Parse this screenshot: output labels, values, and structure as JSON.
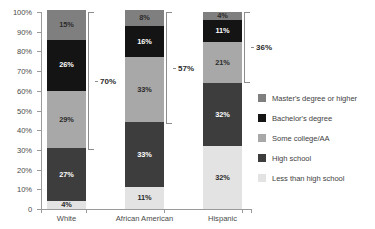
{
  "chart_data": {
    "type": "bar",
    "subtype": "stacked-percentage-column",
    "title": "",
    "xlabel": "",
    "ylabel": "",
    "ylim": [
      0,
      100
    ],
    "yunit": "%",
    "grid": false,
    "legend_position": "right",
    "categories": [
      "White",
      "African American",
      "Hispanic"
    ],
    "ytick_labels": [
      "0",
      "10%",
      "20%",
      "30%",
      "40%",
      "50%",
      "60%",
      "70%",
      "80%",
      "90%",
      "100%"
    ],
    "ytick_values": [
      0,
      10,
      20,
      30,
      40,
      50,
      60,
      70,
      80,
      90,
      100
    ],
    "series": [
      {
        "name": "Less than high school",
        "color": "#e3e3e3",
        "label_color": "dark",
        "values": [
          4,
          11,
          32
        ],
        "labels": [
          "4%",
          "11%",
          "32%"
        ]
      },
      {
        "name": "High school",
        "color": "#3d3d3d",
        "label_color": "light",
        "values": [
          27,
          33,
          32
        ],
        "labels": [
          "27%",
          "33%",
          "32%"
        ]
      },
      {
        "name": "Some college/AA",
        "color": "#a8a8a8",
        "label_color": "dark",
        "values": [
          29,
          33,
          21
        ],
        "labels": [
          "29%",
          "33%",
          "21%"
        ]
      },
      {
        "name": "Bachelor's degree",
        "color": "#141414",
        "label_color": "light",
        "values": [
          26,
          16,
          11
        ],
        "labels": [
          "26%",
          "16%",
          "11%"
        ]
      },
      {
        "name": "Master's degree or higher",
        "color": "#7f7f7f",
        "label_color": "dark",
        "values": [
          15,
          8,
          4
        ],
        "labels": [
          "15%",
          "8%",
          "4%"
        ]
      }
    ],
    "annotations": [
      {
        "name": "bracket-white",
        "label": "70%",
        "from": 30,
        "to": 100,
        "category": "White"
      },
      {
        "name": "bracket-african-american",
        "label": "57%",
        "from": 43,
        "to": 100,
        "category": "African American"
      },
      {
        "name": "bracket-hispanic",
        "label": "36%",
        "from": 64,
        "to": 100,
        "category": "Hispanic"
      }
    ],
    "legend": [
      {
        "label": "Master's degree or higher",
        "color": "#7f7f7f"
      },
      {
        "label": "Bachelor's degree",
        "color": "#141414"
      },
      {
        "label": "Some college/AA",
        "color": "#a8a8a8"
      },
      {
        "label": "High school",
        "color": "#3d3d3d"
      },
      {
        "label": "Less than high school",
        "color": "#e3e3e3"
      }
    ]
  }
}
